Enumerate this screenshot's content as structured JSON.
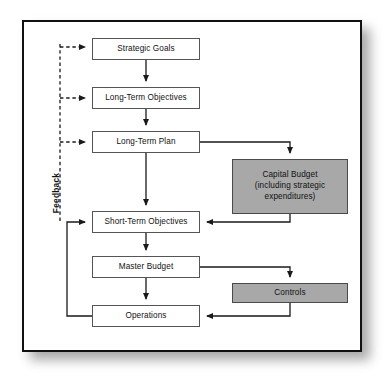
{
  "diagram": {
    "feedback_label": "Feedback",
    "colors": {
      "shaded_fill": "#a8a8a8",
      "plain_fill": "#ffffff",
      "stroke": "#555555",
      "frame": "#111111"
    },
    "nodes": [
      {
        "id": "strategic-goals",
        "label": "Strategic Goals",
        "shaded": false,
        "x": 92,
        "y": 38,
        "w": 108,
        "h": 22
      },
      {
        "id": "long-term-objectives",
        "label": "Long-Term Objectives",
        "shaded": false,
        "x": 92,
        "y": 87,
        "w": 108,
        "h": 22
      },
      {
        "id": "long-term-plan",
        "label": "Long-Term Plan",
        "shaded": false,
        "x": 92,
        "y": 131,
        "w": 108,
        "h": 22
      },
      {
        "id": "capital-budget",
        "label": "Capital Budget (including strategic expenditures)",
        "label_lines": [
          "Capital Budget",
          "(including strategic",
          "expenditures)"
        ],
        "shaded": true,
        "x": 232,
        "y": 159,
        "w": 116,
        "h": 55
      },
      {
        "id": "short-term-objectives",
        "label": "Short-Term Objectives",
        "shaded": false,
        "x": 92,
        "y": 211,
        "w": 108,
        "h": 22
      },
      {
        "id": "master-budget",
        "label": "Master Budget",
        "shaded": false,
        "x": 92,
        "y": 256,
        "w": 108,
        "h": 22
      },
      {
        "id": "controls",
        "label": "Controls",
        "shaded": true,
        "x": 232,
        "y": 283,
        "w": 116,
        "h": 20
      },
      {
        "id": "operations",
        "label": "Operations",
        "shaded": false,
        "x": 92,
        "y": 305,
        "w": 108,
        "h": 22
      }
    ],
    "edges": [
      {
        "id": "strategic-goals-to-long-term-objectives",
        "from": "strategic-goals",
        "to": "long-term-objectives",
        "style": "solid"
      },
      {
        "id": "long-term-objectives-to-long-term-plan",
        "from": "long-term-objectives",
        "to": "long-term-plan",
        "style": "solid"
      },
      {
        "id": "long-term-plan-to-short-term-objectives",
        "from": "long-term-plan",
        "to": "short-term-objectives",
        "style": "solid"
      },
      {
        "id": "long-term-plan-to-capital-budget",
        "from": "long-term-plan",
        "to": "capital-budget",
        "style": "solid"
      },
      {
        "id": "capital-budget-to-short-term-objectives",
        "from": "capital-budget",
        "to": "short-term-objectives",
        "style": "solid"
      },
      {
        "id": "short-term-objectives-to-master-budget",
        "from": "short-term-objectives",
        "to": "master-budget",
        "style": "solid"
      },
      {
        "id": "master-budget-to-operations",
        "from": "master-budget",
        "to": "operations",
        "style": "solid"
      },
      {
        "id": "master-budget-to-controls",
        "from": "master-budget",
        "to": "controls",
        "style": "solid"
      },
      {
        "id": "controls-to-operations",
        "from": "controls",
        "to": "operations",
        "style": "solid"
      },
      {
        "id": "operations-to-short-term-objectives",
        "from": "operations",
        "to": "short-term-objectives",
        "style": "solid"
      },
      {
        "id": "feedback-to-strategic-goals",
        "from": "feedback-bus",
        "to": "strategic-goals",
        "style": "dashed"
      },
      {
        "id": "feedback-to-long-term-objectives",
        "from": "feedback-bus",
        "to": "long-term-objectives",
        "style": "dashed"
      },
      {
        "id": "feedback-to-long-term-plan",
        "from": "feedback-bus",
        "to": "long-term-plan",
        "style": "dashed"
      }
    ]
  }
}
